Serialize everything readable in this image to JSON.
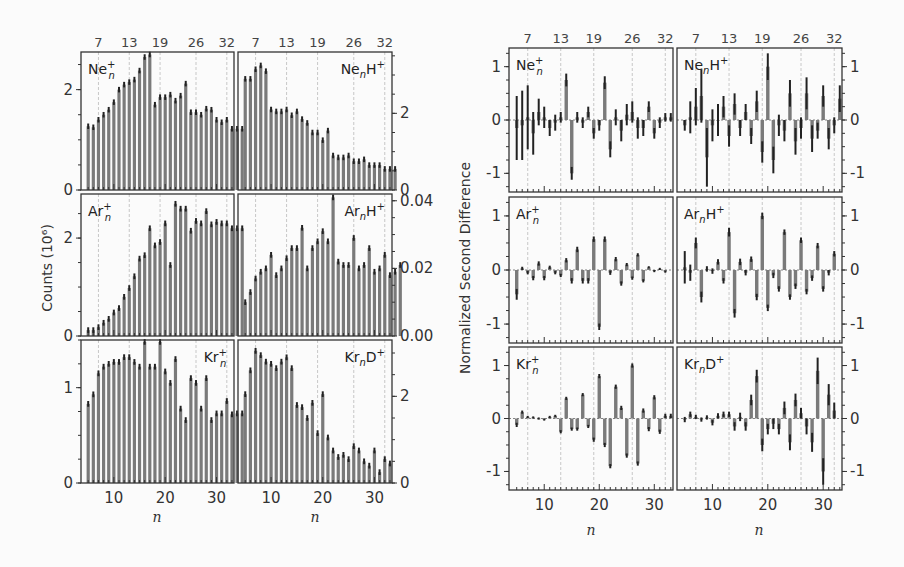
{
  "figure": {
    "left_ylabel": "Counts (10⁶)",
    "right_ylabel": "Normalized Second Difference",
    "xlabel": "n",
    "magic_numbers": [
      7,
      13,
      19,
      26,
      32
    ],
    "bottom_ticks": [
      10,
      20,
      30
    ],
    "colors": {
      "bar": "#7a7a7a",
      "errorbar": "#222222",
      "frame": "#333333",
      "grid": "#bbbbbb"
    }
  },
  "chart_data": [
    {
      "type": "bar",
      "panel": "counts",
      "label": "Ne_n^+",
      "label_sup": "+",
      "label_base": "Ne",
      "label_sub": "n",
      "n_start": 5,
      "ylim": [
        0,
        2.75
      ],
      "yticks": [
        0,
        2
      ],
      "yticks_side": "left",
      "label_pos": "left",
      "values": [
        1.27,
        1.25,
        1.4,
        1.5,
        1.6,
        1.75,
        2.0,
        2.1,
        2.15,
        2.2,
        2.38,
        2.65,
        2.7,
        1.7,
        1.85,
        1.85,
        1.9,
        1.78,
        1.88,
        2.12,
        1.55,
        1.55,
        1.5,
        1.62,
        1.6,
        1.4,
        1.35,
        1.4,
        1.22,
        1.22,
        1.22
      ]
    },
    {
      "type": "bar",
      "panel": "counts",
      "label": "Ne_nH^+",
      "label_base": "Ne",
      "label_sub": "n",
      "label_tail": "H",
      "label_sup": "+",
      "n_start": 5,
      "ylim": [
        0,
        3.6
      ],
      "yticks": [
        0,
        2
      ],
      "yticks_side": "right",
      "label_pos": "right",
      "values": [
        2.9,
        2.9,
        3.15,
        3.25,
        3.1,
        2.1,
        2.05,
        2.05,
        2.1,
        1.95,
        2.05,
        1.85,
        1.75,
        1.5,
        1.5,
        1.3,
        1.55,
        0.9,
        0.85,
        0.85,
        0.9,
        0.75,
        0.75,
        0.8,
        0.65,
        0.65,
        0.65,
        0.55,
        0.55,
        0.55
      ]
    },
    {
      "type": "bar",
      "panel": "counts",
      "label": "Ar_n^+",
      "label_base": "Ar",
      "label_sub": "n",
      "label_sup": "+",
      "n_start": 5,
      "ylim": [
        0,
        2.9
      ],
      "yticks": [
        0,
        2
      ],
      "yticks_side": "left",
      "label_pos": "left",
      "values": [
        0.12,
        0.12,
        0.18,
        0.27,
        0.35,
        0.48,
        0.57,
        0.8,
        0.98,
        1.22,
        1.58,
        1.65,
        2.2,
        1.85,
        1.92,
        2.3,
        1.45,
        2.7,
        2.6,
        2.6,
        2.15,
        2.35,
        2.3,
        2.55,
        2.28,
        2.33,
        2.3,
        2.3,
        2.2,
        2.2,
        2.2
      ]
    },
    {
      "type": "bar",
      "panel": "counts",
      "label": "Ar_nH^+",
      "label_base": "Ar",
      "label_sub": "n",
      "label_tail": "H",
      "label_sup": "+",
      "n_start": 5,
      "ylim": [
        0,
        0.042
      ],
      "yticks": [
        0.0,
        0.02,
        0.04
      ],
      "ytick_labels": [
        "0.00",
        "0.02",
        "0.04"
      ],
      "yticks_side": "right",
      "label_pos": "right",
      "values": [
        0.01,
        0.013,
        0.017,
        0.019,
        0.02,
        0.024,
        0.018,
        0.02,
        0.023,
        0.026,
        0.026,
        0.032,
        0.02,
        0.026,
        0.028,
        0.031,
        0.028,
        0.041,
        0.022,
        0.021,
        0.021,
        0.029,
        0.02,
        0.021,
        0.026,
        0.019,
        0.02,
        0.024,
        0.018,
        0.019,
        0.021
      ]
    },
    {
      "type": "bar",
      "panel": "counts",
      "label": "Kr_n^+",
      "label_base": "Kr",
      "label_sub": "n",
      "label_sup": "+",
      "n_start": 5,
      "ylim": [
        0,
        1.5
      ],
      "yticks": [
        0,
        1
      ],
      "yticks_side": "left",
      "label_pos": "right",
      "values": [
        0.83,
        0.93,
        1.15,
        1.22,
        1.25,
        1.27,
        1.27,
        1.32,
        1.32,
        1.27,
        1.22,
        1.48,
        1.22,
        1.22,
        1.48,
        1.17,
        1.05,
        1.3,
        0.78,
        0.66,
        1.1,
        1.05,
        0.78,
        1.1,
        0.66,
        0.73,
        0.73,
        0.86,
        0.72,
        0.73,
        0.73
      ]
    },
    {
      "type": "bar",
      "panel": "counts",
      "label": "Kr_nD^+",
      "label_base": "Kr",
      "label_sub": "n",
      "label_tail": "D",
      "label_sup": "+",
      "n_start": 5,
      "ylim": [
        0,
        3.3
      ],
      "yticks": [
        0,
        2
      ],
      "yticks_side": "right",
      "label_pos": "right",
      "values": [
        2.05,
        2.6,
        3.05,
        2.95,
        2.8,
        2.75,
        2.65,
        2.8,
        2.9,
        2.65,
        1.8,
        1.75,
        1.5,
        1.85,
        1.15,
        2.05,
        1.05,
        0.75,
        0.6,
        0.65,
        0.55,
        0.85,
        0.75,
        0.5,
        0.4,
        0.75,
        0.25,
        0.55,
        0.45
      ]
    },
    {
      "type": "bar",
      "panel": "second_difference",
      "label": "Ne_n^+",
      "label_base": "Ne",
      "label_sub": "n",
      "label_sup": "+",
      "n_start": 5,
      "ylim": [
        -1.35,
        1.35
      ],
      "yticks": [
        -1,
        0,
        1
      ],
      "yticks_side": "left",
      "label_pos": "left",
      "values": [
        -0.15,
        -0.1,
        0.05,
        -0.25,
        0.15,
        0.05,
        -0.15,
        -0.05,
        0.05,
        0.75,
        -1.0,
        0.05,
        -0.05,
        0.15,
        -0.25,
        -0.1,
        0.7,
        -0.55,
        0.05,
        -0.2,
        0.1,
        0.15,
        -0.15,
        -0.15,
        0.25,
        -0.25,
        -0.05,
        0.05,
        0.05
      ],
      "errors": [
        0.6,
        0.65,
        0.6,
        0.4,
        0.25,
        0.2,
        0.15,
        0.15,
        0.1,
        0.12,
        0.12,
        0.1,
        0.1,
        0.1,
        0.1,
        0.1,
        0.12,
        0.15,
        0.15,
        0.2,
        0.2,
        0.2,
        0.2,
        0.15,
        0.1,
        0.1,
        0.1,
        0.08,
        0.08
      ]
    },
    {
      "type": "bar",
      "panel": "second_difference",
      "label": "Ne_nH^+",
      "label_base": "Ne",
      "label_sub": "n",
      "label_tail": "H",
      "label_sup": "+",
      "n_start": 5,
      "ylim": [
        -1.35,
        1.35
      ],
      "yticks": [
        -1,
        0,
        1
      ],
      "yticks_side": "right",
      "label_pos": "left",
      "values": [
        -0.1,
        0.05,
        0.25,
        0.45,
        -0.7,
        -0.1,
        0.0,
        0.25,
        -0.3,
        0.3,
        -0.15,
        0.15,
        -0.3,
        0.35,
        -0.6,
        1.0,
        -0.75,
        -0.1,
        -0.2,
        0.5,
        -0.4,
        -0.15,
        0.5,
        -0.35,
        -0.2,
        0.45,
        -0.35,
        -0.1,
        0.4
      ],
      "errors": [
        0.1,
        0.3,
        0.35,
        0.5,
        0.55,
        0.3,
        0.3,
        0.2,
        0.2,
        0.2,
        0.15,
        0.15,
        0.15,
        0.2,
        0.2,
        0.25,
        0.25,
        0.2,
        0.2,
        0.25,
        0.25,
        0.2,
        0.3,
        0.25,
        0.15,
        0.2,
        0.2,
        0.15,
        0.25
      ]
    },
    {
      "type": "bar",
      "panel": "second_difference",
      "label": "Ar_n^+",
      "label_base": "Ar",
      "label_sub": "n",
      "label_sup": "+",
      "n_start": 5,
      "ylim": [
        -1.35,
        1.35
      ],
      "yticks": [
        -1,
        0,
        1
      ],
      "yticks_side": "left",
      "label_pos": "left",
      "values": [
        -0.45,
        0.03,
        -0.05,
        -0.15,
        0.12,
        -0.15,
        0.05,
        -0.05,
        -0.1,
        0.18,
        -0.2,
        0.38,
        -0.2,
        -0.2,
        0.57,
        -1.05,
        0.57,
        -0.05,
        0.2,
        -0.25,
        0.1,
        -0.15,
        0.28,
        -0.2,
        0.05,
        -0.02,
        0.02,
        -0.03
      ],
      "errors": [
        0.1,
        0.03,
        0.03,
        0.04,
        0.04,
        0.04,
        0.03,
        0.03,
        0.03,
        0.04,
        0.05,
        0.05,
        0.05,
        0.05,
        0.05,
        0.06,
        0.05,
        0.04,
        0.04,
        0.04,
        0.03,
        0.03,
        0.03,
        0.03,
        0.02,
        0.02,
        0.02,
        0.02
      ]
    },
    {
      "type": "bar",
      "panel": "second_difference",
      "label": "Ar_nH^+",
      "label_base": "Ar",
      "label_sub": "n",
      "label_tail": "H",
      "label_sup": "+",
      "n_start": 5,
      "ylim": [
        -1.35,
        1.35
      ],
      "yticks": [
        -1,
        0,
        1
      ],
      "yticks_side": "right",
      "label_pos": "left",
      "values": [
        0.05,
        -0.05,
        0.5,
        -0.5,
        0.02,
        -0.02,
        0.15,
        -0.2,
        0.7,
        -0.8,
        0.15,
        -0.05,
        0.2,
        -0.5,
        1.0,
        -0.7,
        -0.1,
        -0.35,
        0.7,
        -0.5,
        -0.3,
        0.55,
        -0.4,
        -0.15,
        0.45,
        -0.35,
        -0.05,
        0.3
      ],
      "errors": [
        0.3,
        0.15,
        0.1,
        0.1,
        0.05,
        0.05,
        0.05,
        0.05,
        0.08,
        0.08,
        0.06,
        0.05,
        0.05,
        0.06,
        0.06,
        0.06,
        0.05,
        0.05,
        0.05,
        0.05,
        0.05,
        0.05,
        0.05,
        0.05,
        0.05,
        0.05,
        0.05,
        0.05
      ]
    },
    {
      "type": "bar",
      "panel": "second_difference",
      "label": "Kr_n^+",
      "label_base": "Kr",
      "label_sub": "n",
      "label_sup": "+",
      "n_start": 5,
      "ylim": [
        -1.35,
        1.35
      ],
      "yticks": [
        -1,
        0,
        1
      ],
      "yticks_side": "left",
      "label_pos": "left",
      "values": [
        -0.12,
        0.12,
        0.03,
        0.02,
        0.0,
        -0.02,
        0.03,
        0.05,
        -0.25,
        0.38,
        -0.2,
        -0.2,
        0.45,
        -0.15,
        -0.4,
        0.8,
        -0.5,
        -0.9,
        0.6,
        0.2,
        -0.7,
        1.0,
        -0.85,
        0.15,
        -0.2,
        0.4,
        -0.25,
        0.05,
        0.05
      ],
      "errors": [
        0.04,
        0.03,
        0.02,
        0.02,
        0.02,
        0.02,
        0.02,
        0.02,
        0.03,
        0.03,
        0.03,
        0.03,
        0.03,
        0.03,
        0.04,
        0.04,
        0.04,
        0.04,
        0.04,
        0.04,
        0.04,
        0.04,
        0.04,
        0.04,
        0.04,
        0.04,
        0.04,
        0.04,
        0.04
      ]
    },
    {
      "type": "bar",
      "panel": "second_difference",
      "label": "Kr_nD^+",
      "label_base": "Kr",
      "label_sub": "n",
      "label_tail": "D",
      "label_sup": "+",
      "n_start": 5,
      "ylim": [
        -1.35,
        1.35
      ],
      "yticks": [
        -1,
        0,
        1
      ],
      "yticks_side": "right",
      "label_pos": "left",
      "values": [
        -0.02,
        0.08,
        0.03,
        -0.02,
        0.02,
        -0.08,
        0.05,
        0.08,
        0.08,
        -0.15,
        0.03,
        -0.15,
        0.35,
        0.8,
        -0.5,
        -0.2,
        -0.1,
        -0.2,
        0.2,
        -0.45,
        0.35,
        0.1,
        -0.15,
        -0.45,
        0.9,
        -1.0,
        0.45,
        0.15
      ],
      "errors": [
        0.05,
        0.05,
        0.04,
        0.04,
        0.04,
        0.05,
        0.05,
        0.05,
        0.05,
        0.08,
        0.08,
        0.08,
        0.1,
        0.12,
        0.12,
        0.1,
        0.1,
        0.1,
        0.12,
        0.15,
        0.12,
        0.1,
        0.15,
        0.18,
        0.25,
        0.25,
        0.2,
        0.15
      ]
    }
  ]
}
